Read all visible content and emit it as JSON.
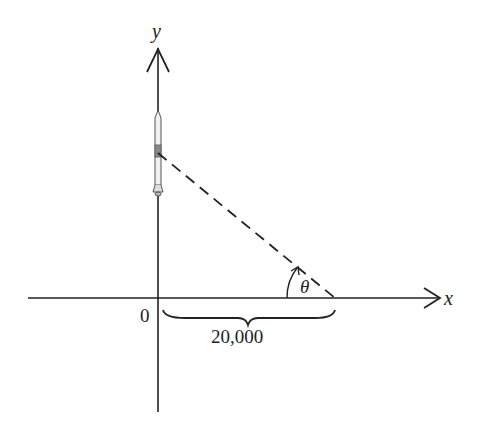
{
  "diagram": {
    "axes": {
      "x_label": "x",
      "y_label": "y",
      "origin_label": "0"
    },
    "distance_label": "20,000",
    "angle_label": "θ",
    "objects": {
      "rocket": "rocket-icon",
      "line_of_sight": "dashed-line"
    },
    "colors": {
      "ink": "#222222",
      "background": "#ffffff"
    }
  }
}
